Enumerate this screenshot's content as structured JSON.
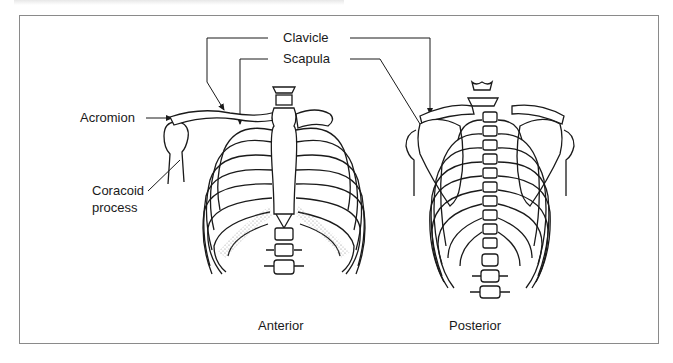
{
  "figure": {
    "caption_cutoff_text": "",
    "labels": {
      "clavicle": "Clavicle",
      "scapula": "Scapula",
      "acromion": "Acromion",
      "coracoid_line1": "Coracoid",
      "coracoid_line2": "process"
    },
    "views": {
      "anterior": "Anterior",
      "posterior": "Posterior"
    },
    "colors": {
      "line": "#1a1a1a",
      "frame": "#8a8a8a",
      "background": "#ffffff",
      "cartilage_stipple": "#9a9a9a"
    }
  }
}
